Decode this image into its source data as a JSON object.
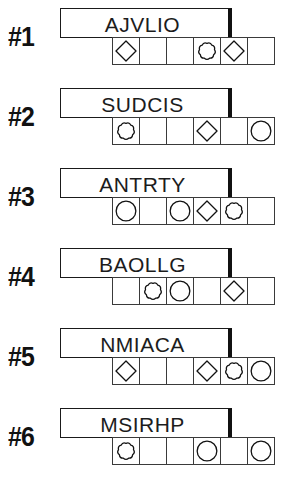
{
  "worksheet": {
    "shape_legend": {
      "empty": "empty-cell",
      "diamond": "diamond-shape",
      "circle": "circle-shape",
      "flower": "scalloped-flower-shape"
    },
    "colors": {
      "ink": "#111111",
      "cell_stroke": "#3a3a3a",
      "paper": "#ffffff"
    },
    "cells_per_row": 6,
    "rows": [
      {
        "index_label": "#1",
        "word": "AJVLIO",
        "cells": [
          "diamond",
          "empty",
          "empty",
          "flower",
          "diamond",
          "empty"
        ]
      },
      {
        "index_label": "#2",
        "word": "SUDCIS",
        "cells": [
          "flower",
          "empty",
          "empty",
          "diamond",
          "empty",
          "circle"
        ]
      },
      {
        "index_label": "#3",
        "word": "ANTRTY",
        "cells": [
          "circle",
          "empty",
          "circle",
          "diamond",
          "flower",
          "empty"
        ]
      },
      {
        "index_label": "#4",
        "word": "BAOLLG",
        "cells": [
          "empty",
          "flower",
          "circle",
          "empty",
          "diamond",
          "empty"
        ]
      },
      {
        "index_label": "#5",
        "word": "NMIACA",
        "cells": [
          "diamond",
          "empty",
          "empty",
          "diamond",
          "flower",
          "circle"
        ]
      },
      {
        "index_label": "#6",
        "word": "MSIRHP",
        "cells": [
          "flower",
          "empty",
          "empty",
          "circle",
          "empty",
          "circle"
        ]
      }
    ]
  }
}
